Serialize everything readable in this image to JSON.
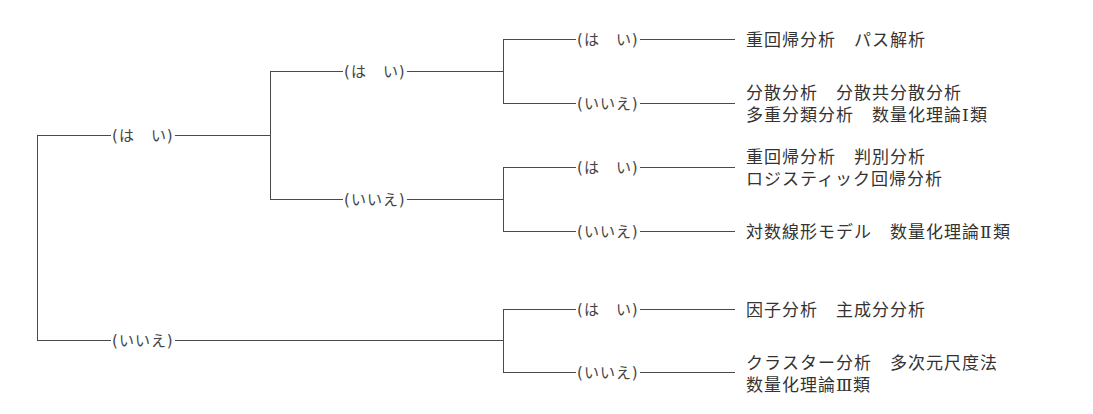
{
  "diagram": {
    "type": "decision-tree",
    "line_color": "#4a4a4a",
    "text_color": "#333333",
    "root": {
      "yes_label": "(は　い)",
      "no_label": "(いいえ)"
    },
    "level2": {
      "yes_label": "(は　い)",
      "no_label": "(いいえ)"
    },
    "leaves": [
      {
        "path": "はい-はい-はい",
        "edge_label": "(は　い)",
        "lines": [
          "重回帰分析　パス解析"
        ]
      },
      {
        "path": "はい-はい-いいえ",
        "edge_label": "(いいえ)",
        "lines": [
          "分散分析　分散共分散分析",
          "多重分類分析　数量化理論Ⅰ類"
        ]
      },
      {
        "path": "はい-いいえ-はい",
        "edge_label": "(は　い)",
        "lines": [
          "重回帰分析　判別分析",
          "ロジスティック回帰分析"
        ]
      },
      {
        "path": "はい-いいえ-いいえ",
        "edge_label": "(いいえ)",
        "lines": [
          "対数線形モデル　数量化理論Ⅱ類"
        ]
      },
      {
        "path": "いいえ-はい",
        "edge_label": "(は　い)",
        "lines": [
          "因子分析　主成分分析"
        ]
      },
      {
        "path": "いいえ-いいえ",
        "edge_label": "(いいえ)",
        "lines": [
          "クラスター分析　多次元尺度法",
          "数量化理論Ⅲ類"
        ]
      }
    ]
  }
}
